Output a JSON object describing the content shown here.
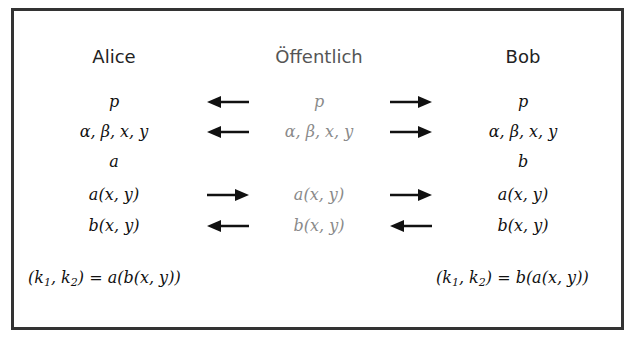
{
  "diagram": {
    "columns": {
      "alice": "Alice",
      "public": "Öffentlich",
      "bob": "Bob"
    },
    "rows": [
      {
        "alice": "p",
        "arrow_left": "left",
        "public": "p",
        "arrow_right": "right",
        "bob": "p"
      },
      {
        "alice": "α, β, x, y",
        "arrow_left": "left",
        "public": "α, β, x, y",
        "arrow_right": "right",
        "bob": "α, β, x, y"
      },
      {
        "alice": "a",
        "arrow_left": "",
        "public": "",
        "arrow_right": "",
        "bob": "b"
      },
      {
        "alice": "a(x, y)",
        "arrow_left": "right",
        "public": "a(x, y)",
        "arrow_right": "right",
        "bob": "a(x, y)"
      },
      {
        "alice": "b(x, y)",
        "arrow_left": "left",
        "public": "b(x, y)",
        "arrow_right": "left",
        "bob": "b(x, y)"
      }
    ],
    "results": {
      "alice_lhs": "(k",
      "alice_sub1": "1",
      "alice_mid": ", k",
      "alice_sub2": "2",
      "alice_rhs": ") = a(b(x, y))",
      "bob_lhs": "(k",
      "bob_sub1": "1",
      "bob_mid": ", k",
      "bob_sub2": "2",
      "bob_rhs": ") = b(a(x, y))"
    },
    "colors": {
      "border": "#333333",
      "text": "#111111",
      "public_text": "#8a8a8a",
      "arrow": "#111111"
    }
  }
}
